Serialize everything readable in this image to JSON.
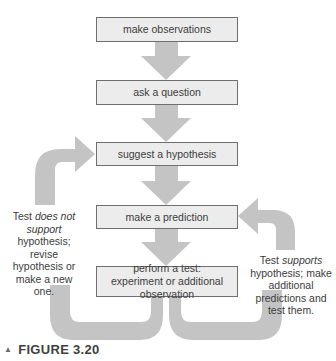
{
  "diagram": {
    "steps": [
      {
        "label": "make observations"
      },
      {
        "label": "ask a question"
      },
      {
        "label": "suggest a hypothesis"
      },
      {
        "label": "make a prediction"
      },
      {
        "label": "perform a test: experiment or additional observation"
      }
    ],
    "left_note": {
      "prefix": "Test ",
      "emphasis": "does not support",
      "suffix": " hypothesis; revise hypothesis or make a new one."
    },
    "right_note": {
      "prefix": "Test ",
      "emphasis": "supports",
      "suffix": " hypothesis; make additional predictions and test them."
    },
    "colors": {
      "arrow_fill": "#c4c4c4",
      "box_fill": "#ececec",
      "box_border": "#6f6f6f"
    }
  },
  "caption": {
    "marker": "▲",
    "text": "FIGURE 3.20"
  }
}
